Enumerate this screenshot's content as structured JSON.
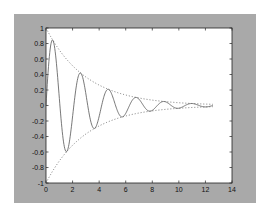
{
  "figure": {
    "background": "#a9a9a9",
    "axes_background": "#ffffff"
  },
  "chart_data": {
    "type": "line",
    "title": "",
    "xlabel": "",
    "ylabel": "",
    "xlim": [
      0,
      14
    ],
    "ylim": [
      -1,
      1
    ],
    "grid": false,
    "legend": null,
    "xticks": [
      "0",
      "2",
      "4",
      "6",
      "8",
      "10",
      "12",
      "14"
    ],
    "yticks": [
      "1",
      "0.8",
      "0.6",
      "0.4",
      "0.2",
      "0",
      "-0.2",
      "-0.4",
      "-0.6",
      "-0.8",
      "-1"
    ],
    "x_range": [
      0,
      12.566
    ],
    "series": [
      {
        "name": "damped oscillation",
        "formula": "y = exp(-t/3) * sin(3t)",
        "style": "solid",
        "color": "#555555",
        "sample_points": [
          [
            0,
            0
          ],
          [
            0.52,
            0.83
          ],
          [
            1.57,
            -0.59
          ],
          [
            2.62,
            0.42
          ],
          [
            3.67,
            -0.29
          ],
          [
            4.71,
            0.21
          ],
          [
            5.76,
            -0.15
          ],
          [
            6.81,
            0.1
          ],
          [
            7.85,
            -0.07
          ],
          [
            8.9,
            0.05
          ],
          [
            9.95,
            -0.04
          ],
          [
            11.0,
            0.03
          ],
          [
            12.04,
            -0.02
          ],
          [
            12.57,
            0
          ]
        ]
      },
      {
        "name": "upper envelope",
        "formula": "y = exp(-t/3)",
        "style": "dotted",
        "color": "#555555",
        "sample_points": [
          [
            0,
            1
          ],
          [
            2,
            0.51
          ],
          [
            4,
            0.26
          ],
          [
            6,
            0.14
          ],
          [
            8,
            0.07
          ],
          [
            10,
            0.04
          ],
          [
            12.57,
            0.015
          ]
        ]
      },
      {
        "name": "lower envelope",
        "formula": "y = -exp(-t/3)",
        "style": "dotted",
        "color": "#555555",
        "sample_points": [
          [
            0,
            -1
          ],
          [
            2,
            -0.51
          ],
          [
            4,
            -0.26
          ],
          [
            6,
            -0.14
          ],
          [
            8,
            -0.07
          ],
          [
            10,
            -0.04
          ],
          [
            12.57,
            -0.015
          ]
        ]
      }
    ]
  }
}
